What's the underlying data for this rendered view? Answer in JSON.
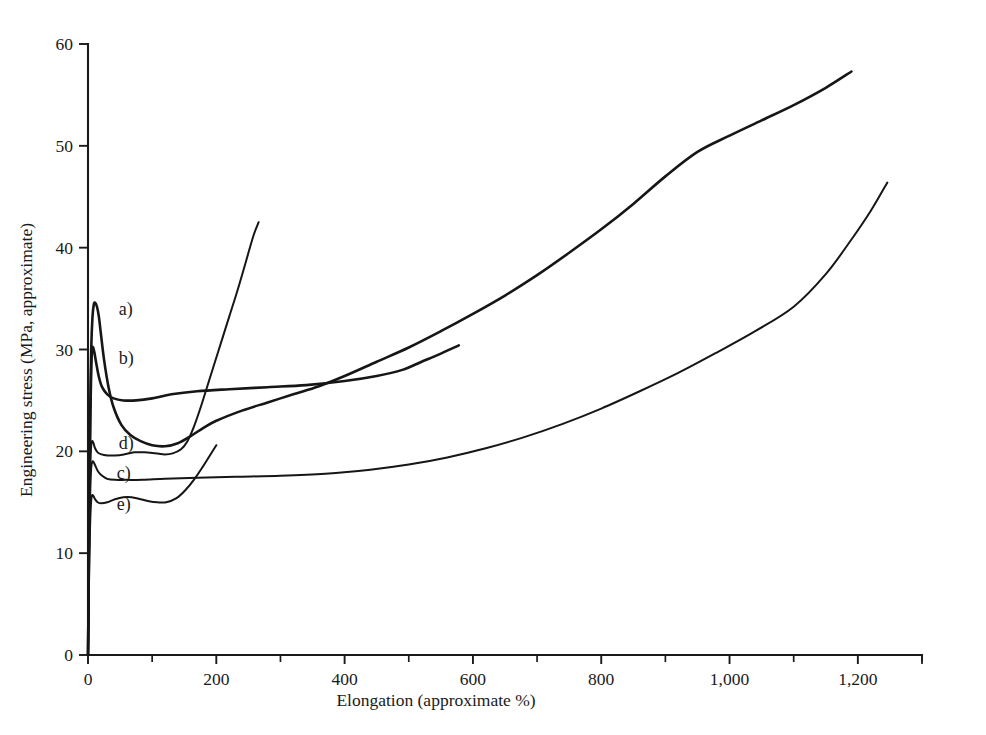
{
  "chart_data": {
    "type": "line",
    "title": "",
    "xlabel": "Elongation (approximate %)",
    "ylabel": "Engineering stress (MPa, approximate)",
    "xlim": [
      0,
      1300
    ],
    "ylim": [
      0,
      60
    ],
    "xticks": [
      0,
      200,
      400,
      600,
      800,
      1000,
      1200
    ],
    "xticklabels": [
      "0",
      "200",
      "400",
      "600",
      "800",
      "1,000",
      "1,200"
    ],
    "xminorticks": [
      100,
      300,
      500,
      700,
      900,
      1100,
      1300
    ],
    "yticks": [
      0,
      10,
      20,
      30,
      40,
      50,
      60
    ],
    "yticklabels": [
      "0",
      "10",
      "20",
      "30",
      "40",
      "50",
      "60"
    ],
    "grid": false,
    "legend_position": "inline-annotations",
    "annotations": [
      {
        "label": "a)",
        "x": 48,
        "y": 34.0
      },
      {
        "label": "b)",
        "x": 48,
        "y": 29.2
      },
      {
        "label": "d)",
        "x": 48,
        "y": 20.8
      },
      {
        "label": "c)",
        "x": 45,
        "y": 17.9
      },
      {
        "label": "e)",
        "x": 45,
        "y": 14.8
      }
    ],
    "series": [
      {
        "name": "a)",
        "comment": "highest yield peak ~34.6 MPa, strain-softens then rises steeply, ends ~1190% at 57.3 MPa",
        "points": [
          [
            0,
            0
          ],
          [
            1,
            6.5
          ],
          [
            2,
            15.0
          ],
          [
            3.5,
            24.0
          ],
          [
            5,
            30.0
          ],
          [
            7,
            33.2
          ],
          [
            9,
            34.4
          ],
          [
            11,
            34.6
          ],
          [
            14,
            34.2
          ],
          [
            17,
            33.2
          ],
          [
            20,
            31.6
          ],
          [
            25,
            29.0
          ],
          [
            32,
            26.3
          ],
          [
            40,
            24.3
          ],
          [
            52,
            22.6
          ],
          [
            66,
            21.6
          ],
          [
            82,
            21.0
          ],
          [
            100,
            20.6
          ],
          [
            120,
            20.5
          ],
          [
            140,
            20.8
          ],
          [
            160,
            21.5
          ],
          [
            180,
            22.3
          ],
          [
            200,
            23.0
          ],
          [
            240,
            24.0
          ],
          [
            280,
            24.8
          ],
          [
            320,
            25.6
          ],
          [
            360,
            26.4
          ],
          [
            400,
            27.4
          ],
          [
            450,
            28.8
          ],
          [
            500,
            30.2
          ],
          [
            550,
            31.8
          ],
          [
            600,
            33.5
          ],
          [
            650,
            35.3
          ],
          [
            700,
            37.3
          ],
          [
            750,
            39.5
          ],
          [
            800,
            41.8
          ],
          [
            850,
            44.3
          ],
          [
            900,
            47.0
          ],
          [
            950,
            49.4
          ],
          [
            1000,
            51.0
          ],
          [
            1050,
            52.5
          ],
          [
            1100,
            54.0
          ],
          [
            1150,
            55.7
          ],
          [
            1190,
            57.3
          ]
        ]
      },
      {
        "name": "b)",
        "comment": "yield peak ~30.2 MPa, drops to long flat plateau ~26 MPa, cut off near 580%",
        "points": [
          [
            0,
            0
          ],
          [
            1,
            6.0
          ],
          [
            2,
            14.5
          ],
          [
            3.5,
            23.0
          ],
          [
            5,
            28.0
          ],
          [
            6.5,
            30.0
          ],
          [
            8,
            30.2
          ],
          [
            10,
            29.7
          ],
          [
            13,
            28.6
          ],
          [
            17,
            27.3
          ],
          [
            22,
            26.3
          ],
          [
            30,
            25.6
          ],
          [
            40,
            25.2
          ],
          [
            55,
            25.0
          ],
          [
            75,
            25.0
          ],
          [
            100,
            25.2
          ],
          [
            130,
            25.6
          ],
          [
            170,
            25.9
          ],
          [
            220,
            26.1
          ],
          [
            280,
            26.3
          ],
          [
            340,
            26.5
          ],
          [
            400,
            26.9
          ],
          [
            450,
            27.4
          ],
          [
            490,
            28.0
          ],
          [
            520,
            28.8
          ],
          [
            550,
            29.6
          ],
          [
            578,
            30.4
          ]
        ]
      },
      {
        "name": "c)",
        "comment": "yield peak ~19.0 MPa, softens to ~17.2 MPa long plateau, rises gradually to ~46.4 MPa at 1246%",
        "points": [
          [
            0,
            0
          ],
          [
            1,
            5.0
          ],
          [
            2,
            11.5
          ],
          [
            3.5,
            16.0
          ],
          [
            5,
            18.4
          ],
          [
            7,
            19.0
          ],
          [
            9,
            18.9
          ],
          [
            12,
            18.5
          ],
          [
            16,
            18.0
          ],
          [
            22,
            17.6
          ],
          [
            30,
            17.3
          ],
          [
            42,
            17.2
          ],
          [
            60,
            17.2
          ],
          [
            85,
            17.2
          ],
          [
            120,
            17.3
          ],
          [
            170,
            17.4
          ],
          [
            230,
            17.5
          ],
          [
            300,
            17.6
          ],
          [
            370,
            17.8
          ],
          [
            440,
            18.2
          ],
          [
            500,
            18.7
          ],
          [
            560,
            19.4
          ],
          [
            620,
            20.3
          ],
          [
            680,
            21.4
          ],
          [
            740,
            22.7
          ],
          [
            800,
            24.2
          ],
          [
            860,
            25.9
          ],
          [
            920,
            27.7
          ],
          [
            980,
            29.7
          ],
          [
            1040,
            31.8
          ],
          [
            1100,
            34.2
          ],
          [
            1150,
            37.4
          ],
          [
            1190,
            40.8
          ],
          [
            1220,
            43.6
          ],
          [
            1246,
            46.4
          ]
        ]
      },
      {
        "name": "d)",
        "comment": "yield peak ~21.0 MPa, dips to ~19.6 MPa then rises very steeply, terminates ~265% at 42.5 MPa",
        "points": [
          [
            0,
            0
          ],
          [
            1,
            5.5
          ],
          [
            2,
            13.0
          ],
          [
            3.5,
            18.4
          ],
          [
            5,
            20.6
          ],
          [
            6.5,
            21.0
          ],
          [
            8.5,
            20.8
          ],
          [
            11,
            20.3
          ],
          [
            15,
            19.9
          ],
          [
            21,
            19.7
          ],
          [
            30,
            19.6
          ],
          [
            42,
            19.6
          ],
          [
            56,
            19.7
          ],
          [
            72,
            19.9
          ],
          [
            88,
            19.9
          ],
          [
            105,
            19.8
          ],
          [
            120,
            19.7
          ],
          [
            132,
            19.8
          ],
          [
            145,
            20.2
          ],
          [
            155,
            21.0
          ],
          [
            165,
            22.4
          ],
          [
            175,
            24.2
          ],
          [
            185,
            26.2
          ],
          [
            196,
            28.4
          ],
          [
            208,
            30.8
          ],
          [
            220,
            33.2
          ],
          [
            233,
            35.8
          ],
          [
            246,
            38.6
          ],
          [
            258,
            41.2
          ],
          [
            266,
            42.5
          ]
        ]
      },
      {
        "name": "e)",
        "comment": "lowest yield peak ~15.7 MPa, dips to ~15.0 MPa then merges upward joining curve a trajectory",
        "points": [
          [
            0,
            0
          ],
          [
            1,
            4.2
          ],
          [
            2,
            9.5
          ],
          [
            3.5,
            13.2
          ],
          [
            5,
            15.2
          ],
          [
            6.5,
            15.7
          ],
          [
            8.5,
            15.6
          ],
          [
            11,
            15.3
          ],
          [
            15,
            15.0
          ],
          [
            21,
            14.9
          ],
          [
            30,
            15.0
          ],
          [
            42,
            15.3
          ],
          [
            55,
            15.5
          ],
          [
            68,
            15.5
          ],
          [
            82,
            15.3
          ],
          [
            95,
            15.1
          ],
          [
            108,
            15.0
          ],
          [
            122,
            15.0
          ],
          [
            138,
            15.4
          ],
          [
            152,
            16.2
          ],
          [
            165,
            17.2
          ],
          [
            178,
            18.4
          ],
          [
            190,
            19.6
          ],
          [
            200,
            20.6
          ]
        ]
      }
    ]
  },
  "figure": {
    "axis_color": "#1a1a1a",
    "curve_color": "#161616",
    "background": "#ffffff"
  }
}
